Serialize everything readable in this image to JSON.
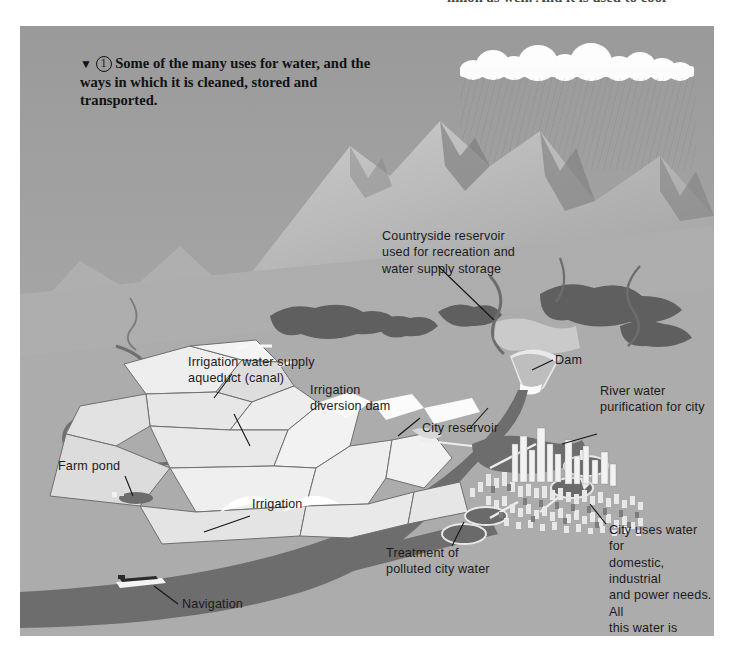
{
  "page": {
    "top_partial_text": "nmon as well. And it is used to cool",
    "figure_number": "1",
    "triangle_marker": "▼"
  },
  "caption": {
    "text": "Some of the many uses for water, and the ways in which it is cleaned, stored and transported."
  },
  "labels": {
    "countryside_reservoir": "Countryside reservoir\nused for recreation and\nwater supply storage",
    "dam": "Dam",
    "river_water_purification": "River water\npurification for city",
    "city_reservoir": "City reservoir",
    "irrigation_aqueduct": "Irrigation water supply\naqueduct (canal)",
    "irrigation_diversion_dam": "Irrigation\ndiversion dam",
    "farm_pond": "Farm pond",
    "irrigation": "Irrigation",
    "navigation": "Navigation",
    "treatment_polluted": "Treatment of\npolluted city water",
    "city_uses": "City uses water for\ndomestic, industrial\nand power needs. All\nthis water is polluted\nand must be cleaned"
  },
  "colors": {
    "sky": "#9d9d9d",
    "ground": "#a9a9a9",
    "water": "#6d6d6d",
    "cloud": "#fdfdfd",
    "field_light": "#f0f0f0",
    "field_mid": "#d2d2d2",
    "forest": "#5f5f5f",
    "text": "#1b1b1b",
    "page_background": "#ffffff"
  },
  "scene_elements": {
    "clouds": "rain-cloud-band",
    "mountains": "mountain-range",
    "rain": "rainfall-streaks",
    "river": "river-course",
    "city": "city-buildings-cluster",
    "boat": "navigation-barge",
    "fields": "farm-fields",
    "forests": "forest-patches"
  }
}
